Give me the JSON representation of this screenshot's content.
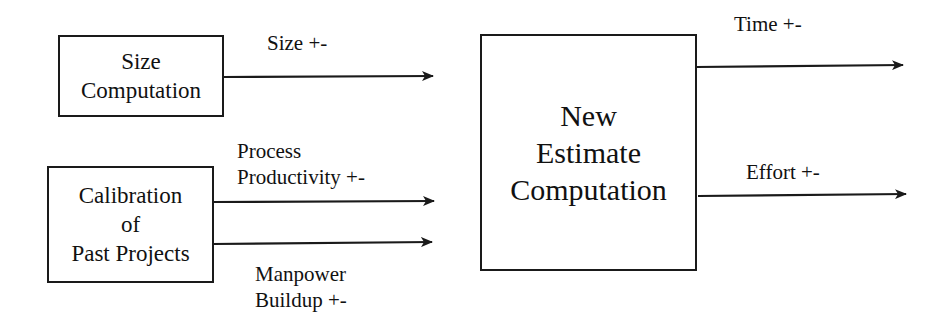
{
  "diagram": {
    "boxes": {
      "size_computation": {
        "lines": [
          "Size",
          "Computation"
        ]
      },
      "calibration": {
        "lines": [
          "Calibration",
          "of",
          "Past Projects"
        ]
      },
      "new_estimate": {
        "lines": [
          "New",
          "Estimate",
          "Computation"
        ]
      }
    },
    "edges": {
      "size": {
        "label": "Size +-",
        "from": "Size Computation",
        "to": "New Estimate Computation"
      },
      "productivity": {
        "label_lines": [
          "Process",
          "Productivity +-"
        ],
        "from": "Calibration of Past Projects",
        "to": "New Estimate Computation"
      },
      "manpower": {
        "label_lines": [
          "Manpower",
          "Buildup +-"
        ],
        "from": "Calibration of Past Projects",
        "to": "New Estimate Computation"
      },
      "time": {
        "label": "Time +-",
        "from": "New Estimate Computation",
        "to": "output"
      },
      "effort": {
        "label": "Effort +-",
        "from": "New Estimate Computation",
        "to": "output"
      }
    },
    "colors": {
      "stroke": "#1a1a1a",
      "background": "#ffffff"
    }
  }
}
